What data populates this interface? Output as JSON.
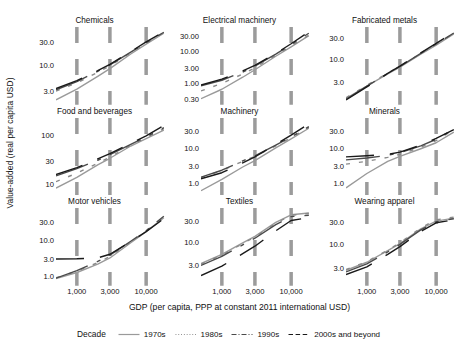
{
  "chart_data": {
    "type": "line",
    "title": "",
    "xlabel": "GDP (per capita, PPP at constant 2011 international USD)",
    "ylabel": "Value-added (real per capita USD)",
    "xscale": "log",
    "yscale": "log",
    "grid": "vertical dashed gridlines at x tick positions only",
    "legend_position": "bottom",
    "legend_title": "Decade",
    "x_tick_labels": [
      "1,000",
      "3,000",
      "10,000"
    ],
    "x_tick_values": [
      1000,
      3000,
      10000
    ],
    "x_range": [
      500,
      20000
    ],
    "series_styles": [
      {
        "name": "1970s",
        "dash": "solid",
        "color": "#9a9a9a"
      },
      {
        "name": "1980s",
        "dash": "dotted",
        "color": "#8a8a8a"
      },
      {
        "name": "1990s",
        "dash": "dash-dot",
        "color": "#4a4a4a"
      },
      {
        "name": "2000s and beyond",
        "dash": "dashed",
        "color": "#1a1a1a"
      }
    ],
    "facets": [
      {
        "title": "Chemicals",
        "y_tick_labels": [
          "30.0",
          "10.0",
          "3.0"
        ],
        "y_tick_values": [
          30.0,
          10.0,
          3.0
        ],
        "ylim": [
          1.6,
          60
        ],
        "series": [
          {
            "name": "1970s",
            "x": [
              500,
              1000,
              2000,
              3000,
              6000,
              10000,
              18000
            ],
            "y": [
              2.0,
              3.3,
              6.0,
              8.6,
              17.0,
              27.0,
              45.0
            ]
          },
          {
            "name": "1980s",
            "x": [
              500,
              1000,
              2000,
              3000,
              6000,
              10000,
              18000
            ],
            "y": [
              3.0,
              4.4,
              7.2,
              9.8,
              18.0,
              28.0,
              46.0
            ]
          },
          {
            "name": "1990s",
            "x": [
              500,
              1000,
              2000,
              3000,
              6000,
              10000,
              18000
            ],
            "y": [
              3.2,
              4.7,
              7.6,
              10.2,
              18.5,
              29.0,
              47.0
            ]
          },
          {
            "name": "2000s and beyond",
            "x": [
              500,
              1000,
              2000,
              3000,
              6000,
              10000,
              18000
            ],
            "y": [
              3.4,
              4.9,
              7.8,
              10.5,
              19.0,
              30.0,
              48.0
            ]
          }
        ]
      },
      {
        "title": "Electrical machinery",
        "y_tick_labels": [
          "30.00",
          "10.00",
          "3.00",
          "1.00",
          "0.30"
        ],
        "y_tick_values": [
          30.0,
          10.0,
          3.0,
          1.0,
          0.3
        ],
        "ylim": [
          0.2,
          60
        ],
        "series": [
          {
            "name": "1970s",
            "x": [
              500,
              1000,
              2000,
              3000,
              6000,
              10000,
              18000
            ],
            "y": [
              0.31,
              0.62,
              1.5,
              2.6,
              7.0,
              14.0,
              32.0
            ]
          },
          {
            "name": "1980s",
            "x": [
              500,
              1000,
              2000,
              3000,
              6000,
              10000,
              18000
            ],
            "y": [
              0.55,
              0.95,
              1.9,
              3.0,
              7.5,
              15.0,
              33.0
            ]
          },
          {
            "name": "1990s",
            "x": [
              500,
              1000,
              2000,
              3000,
              6000,
              10000,
              18000
            ],
            "y": [
              0.8,
              1.2,
              2.2,
              3.4,
              8.2,
              16.5,
              38.0
            ]
          },
          {
            "name": "2000s and beyond",
            "x": [
              500,
              1000,
              2000,
              3000,
              6000,
              10000,
              18000
            ],
            "y": [
              0.85,
              1.3,
              2.4,
              3.6,
              8.6,
              17.5,
              42.0
            ]
          }
        ]
      },
      {
        "title": "Fabricated metals",
        "y_tick_labels": [
          "30.0",
          "10.0",
          "3.0"
        ],
        "y_tick_values": [
          30.0,
          10.0,
          3.0
        ],
        "ylim": [
          0.9,
          55
        ],
        "series": [
          {
            "name": "1970s",
            "x": [
              500,
              1000,
              2000,
              3000,
              6000,
              10000,
              18000
            ],
            "y": [
              1.25,
              2.4,
              4.6,
              6.6,
              13.0,
              21.0,
              38.0
            ]
          },
          {
            "name": "1980s",
            "x": [
              500,
              1000,
              2000,
              3000,
              6000,
              10000,
              18000
            ],
            "y": [
              1.3,
              2.5,
              4.8,
              6.9,
              13.5,
              22.0,
              39.0
            ]
          },
          {
            "name": "1990s",
            "x": [
              500,
              1000,
              2000,
              3000,
              6000,
              10000,
              18000
            ],
            "y": [
              1.2,
              2.4,
              4.7,
              6.8,
              13.6,
              22.5,
              40.0
            ]
          },
          {
            "name": "2000s and beyond",
            "x": [
              500,
              1000,
              2000,
              3000,
              6000,
              10000,
              18000
            ],
            "y": [
              1.15,
              2.3,
              4.7,
              6.9,
              14.0,
              23.0,
              42.0
            ]
          }
        ]
      },
      {
        "title": "Food and beverages",
        "y_tick_labels": [
          "100",
          "30",
          "10"
        ],
        "y_tick_values": [
          100,
          30,
          10
        ],
        "ylim": [
          6,
          220
        ],
        "series": [
          {
            "name": "1970s",
            "x": [
              500,
              1000,
              2000,
              3000,
              6000,
              10000,
              18000
            ],
            "y": [
              8.5,
              14.0,
              25.0,
              34.0,
              60.0,
              85.0,
              125.0
            ]
          },
          {
            "name": "1980s",
            "x": [
              500,
              1000,
              2000,
              3000,
              6000,
              10000,
              18000
            ],
            "y": [
              11.5,
              17.0,
              27.0,
              36.0,
              62.0,
              88.0,
              135.0
            ]
          },
          {
            "name": "1990s",
            "x": [
              500,
              1000,
              2000,
              3000,
              6000,
              10000,
              18000
            ],
            "y": [
              15.0,
              21.0,
              31.0,
              40.0,
              65.0,
              92.0,
              140.0
            ]
          },
          {
            "name": "2000s and beyond",
            "x": [
              500,
              1000,
              2000,
              3000,
              6000,
              10000,
              18000
            ],
            "y": [
              16.0,
              22.0,
              33.0,
              42.0,
              68.0,
              96.0,
              155.0
            ]
          }
        ]
      },
      {
        "title": "Machinery",
        "y_tick_labels": [
          "30.0",
          "10.0",
          "3.0",
          "1.0"
        ],
        "y_tick_values": [
          30.0,
          10.0,
          3.0,
          1.0
        ],
        "ylim": [
          0.45,
          70
        ],
        "series": [
          {
            "name": "1970s",
            "x": [
              500,
              1000,
              2000,
              3000,
              6000,
              10000,
              18000
            ],
            "y": [
              0.62,
              1.3,
              2.9,
              4.4,
              10.0,
              18.0,
              36.0
            ]
          },
          {
            "name": "1980s",
            "x": [
              500,
              1000,
              2000,
              3000,
              6000,
              10000,
              18000
            ],
            "y": [
              1.45,
              2.3,
              4.2,
              5.8,
              11.5,
              19.5,
              38.0
            ]
          },
          {
            "name": "1990s",
            "x": [
              500,
              1000,
              2000,
              3000,
              6000,
              10000,
              18000
            ],
            "y": [
              1.5,
              2.35,
              4.3,
              6.0,
              12.0,
              20.5,
              40.0
            ]
          },
          {
            "name": "2000s and beyond",
            "x": [
              500,
              1000,
              2000,
              3000,
              6000,
              10000,
              18000
            ],
            "y": [
              1.35,
              2.0,
              3.8,
              5.6,
              12.5,
              23.0,
              48.0
            ]
          }
        ]
      },
      {
        "title": "Minerals",
        "y_tick_labels": [
          "30.0",
          "10.0",
          "3.0",
          "1.0"
        ],
        "y_tick_values": [
          30.0,
          10.0,
          3.0,
          1.0
        ],
        "ylim": [
          0.45,
          70
        ],
        "series": [
          {
            "name": "1970s",
            "x": [
              500,
              1000,
              2000,
              3000,
              6000,
              10000,
              18000
            ],
            "y": [
              0.75,
              1.9,
              4.2,
              5.8,
              9.5,
              14.0,
              28.0
            ]
          },
          {
            "name": "1980s",
            "x": [
              500,
              1000,
              2000,
              3000,
              6000,
              10000,
              18000
            ],
            "y": [
              3.5,
              4.2,
              5.4,
              6.6,
              10.5,
              16.0,
              33.0
            ]
          },
          {
            "name": "1990s",
            "x": [
              500,
              1000,
              2000,
              3000,
              6000,
              10000,
              18000
            ],
            "y": [
              4.6,
              5.2,
              6.2,
              7.3,
              11.5,
              17.5,
              34.0
            ]
          },
          {
            "name": "2000s and beyond",
            "x": [
              500,
              1000,
              2000,
              3000,
              6000,
              10000,
              18000
            ],
            "y": [
              5.6,
              6.0,
              6.6,
              7.6,
              12.0,
              18.5,
              33.0
            ]
          }
        ]
      },
      {
        "title": "Motor vehicles",
        "y_tick_labels": [
          "30.0",
          "10.0",
          "3.0",
          "1.0"
        ],
        "y_tick_values": [
          30.0,
          10.0,
          3.0,
          1.0
        ],
        "ylim": [
          0.55,
          70
        ],
        "series": [
          {
            "name": "1970s",
            "x": [
              500,
              1000,
              2000,
              3000,
              6000,
              10000,
              18000
            ],
            "y": [
              0.85,
              1.25,
              2.1,
              3.1,
              8.0,
              16.0,
              38.0
            ]
          },
          {
            "name": "1980s",
            "x": [
              500,
              1000,
              2000,
              3000,
              6000,
              10000,
              18000
            ],
            "y": [
              0.9,
              1.35,
              2.3,
              3.4,
              8.4,
              16.5,
              40.0
            ]
          },
          {
            "name": "1990s",
            "x": [
              500,
              1000,
              2000,
              3000,
              6000,
              10000,
              18000
            ],
            "y": [
              0.88,
              1.4,
              2.5,
              3.7,
              8.8,
              17.0,
              42.0
            ]
          },
          {
            "name": "2000s and beyond",
            "x": [
              500,
              1000,
              2000,
              3000,
              6000,
              10000,
              18000
            ],
            "y": [
              2.9,
              2.95,
              3.1,
              3.9,
              8.6,
              16.0,
              36.0
            ]
          }
        ]
      },
      {
        "title": "Textiles",
        "y_tick_labels": [
          "30.0",
          "10.0",
          "3.0"
        ],
        "y_tick_values": [
          30.0,
          10.0,
          3.0
        ],
        "ylim": [
          1.0,
          60
        ],
        "series": [
          {
            "name": "1970s",
            "x": [
              500,
              1000,
              2000,
              3000,
              6000,
              10000,
              18000
            ],
            "y": [
              3.2,
              5.2,
              9.5,
              13.5,
              28.0,
              42.0,
              46.0
            ]
          },
          {
            "name": "1980s",
            "x": [
              500,
              1000,
              2000,
              3000,
              6000,
              10000,
              18000
            ],
            "y": [
              3.1,
              5.0,
              9.2,
              13.0,
              27.0,
              41.0,
              45.0
            ]
          },
          {
            "name": "1990s",
            "x": [
              500,
              1000,
              2000,
              3000,
              6000,
              10000,
              18000
            ],
            "y": [
              2.9,
              4.7,
              8.6,
              12.2,
              25.0,
              38.0,
              41.0
            ]
          },
          {
            "name": "2000s and beyond",
            "x": [
              500,
              1000,
              2000,
              3000,
              6000,
              10000,
              18000
            ],
            "y": [
              1.7,
              2.8,
              5.4,
              8.0,
              18.0,
              31.0,
              36.0
            ]
          }
        ]
      },
      {
        "title": "Wearing apparel",
        "y_tick_labels": [
          "30.0",
          "10.0",
          "3.0"
        ],
        "y_tick_values": [
          30.0,
          10.0,
          3.0
        ],
        "ylim": [
          1.2,
          60
        ],
        "series": [
          {
            "name": "1970s",
            "x": [
              500,
              1000,
              2000,
              3000,
              6000,
              10000,
              18000
            ],
            "y": [
              2.6,
              3.9,
              7.0,
              10.0,
              21.0,
              31.0,
              36.0
            ]
          },
          {
            "name": "1980s",
            "x": [
              500,
              1000,
              2000,
              3000,
              6000,
              10000,
              18000
            ],
            "y": [
              2.7,
              4.0,
              7.2,
              10.4,
              22.0,
              33.0,
              38.0
            ]
          },
          {
            "name": "1990s",
            "x": [
              500,
              1000,
              2000,
              3000,
              6000,
              10000,
              18000
            ],
            "y": [
              2.4,
              3.6,
              6.6,
              9.6,
              20.0,
              30.0,
              35.0
            ]
          },
          {
            "name": "2000s and beyond",
            "x": [
              500,
              1000,
              2000,
              3000,
              6000,
              10000,
              18000
            ],
            "y": [
              2.1,
              3.1,
              5.8,
              8.6,
              18.5,
              28.5,
              33.0
            ]
          }
        ]
      }
    ]
  }
}
